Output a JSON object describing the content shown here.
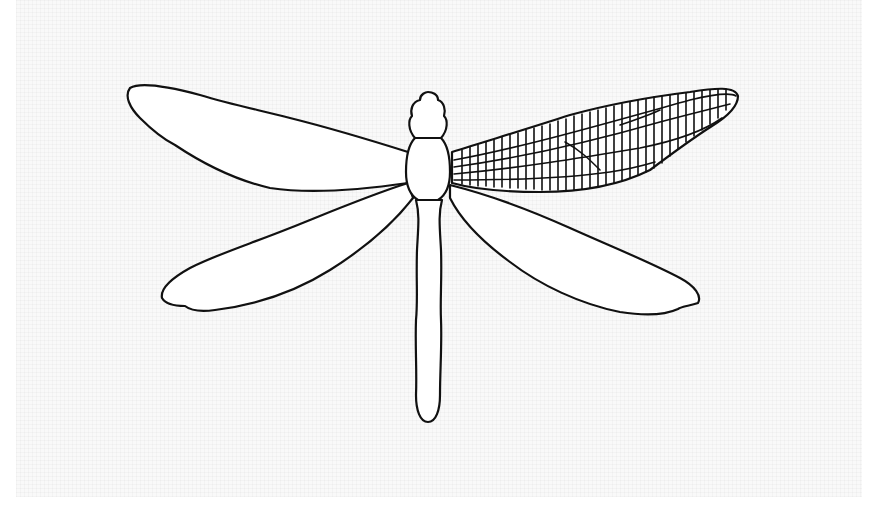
{
  "image": {
    "subject": "dragonfly line drawing",
    "style": "black outline on light grid background",
    "colors": {
      "outline": "#111111",
      "fill": "#ffffff",
      "background": "#f9f9f9",
      "border": "#ffffff"
    },
    "parts": {
      "head": "head",
      "thorax": "thorax",
      "abdomen": "abdomen",
      "upper_left_wing": "upper left wing (plain)",
      "lower_left_wing": "lower left wing (plain)",
      "upper_right_wing": "upper right wing (veined)",
      "lower_right_wing": "lower right wing (plain)"
    }
  }
}
